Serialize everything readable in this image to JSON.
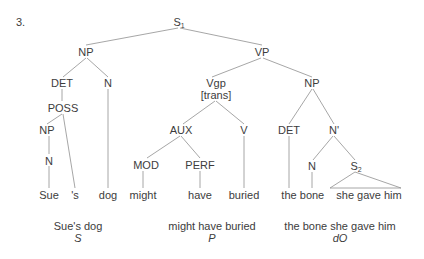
{
  "example_number": "3.",
  "nodes": {
    "s1": {
      "label": "S",
      "sub": "1"
    },
    "np_subj": {
      "label": "NP"
    },
    "vp": {
      "label": "VP"
    },
    "det_subj": {
      "label": "DET"
    },
    "n_subj": {
      "label": "N"
    },
    "poss": {
      "label": "POSS"
    },
    "np_poss": {
      "label": "NP"
    },
    "n_poss": {
      "label": "N"
    },
    "vgp": {
      "label": "Vgp",
      "feature": "[trans]"
    },
    "np_obj": {
      "label": "NP"
    },
    "aux": {
      "label": "AUX"
    },
    "v": {
      "label": "V"
    },
    "mod": {
      "label": "MOD"
    },
    "perf": {
      "label": "PERF"
    },
    "det_obj": {
      "label": "DET"
    },
    "nbar": {
      "label": "N'"
    },
    "n_obj": {
      "label": "N"
    },
    "s2": {
      "label": "S",
      "sub": "2"
    }
  },
  "leaves": [
    "Sue",
    "'s",
    "dog",
    "might",
    "have",
    "buried",
    "the",
    "bone",
    "she gave him"
  ],
  "constituents": [
    {
      "text": "Sue's dog",
      "role": "S"
    },
    {
      "text": "might have buried",
      "role": "P"
    },
    {
      "text": "the bone she gave him",
      "role": "dO"
    }
  ],
  "colors": {
    "line": "#8a8a8a",
    "text": "#3c3c3c"
  }
}
